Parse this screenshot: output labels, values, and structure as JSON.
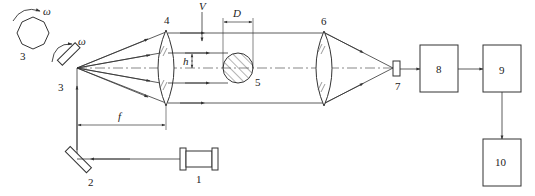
{
  "diagram": {
    "type": "laser-scanning-diameter-measurement-schematic",
    "components": [
      {
        "id": "1",
        "label": "1",
        "role": "laser source"
      },
      {
        "id": "2",
        "label": "2",
        "role": "fold mirror"
      },
      {
        "id": "3a",
        "label": "3",
        "role": "rotating polygon mirror (top view)"
      },
      {
        "id": "3b",
        "label": "3",
        "role": "rotating scanning mirror"
      },
      {
        "id": "4",
        "label": "4",
        "role": "collimating lens"
      },
      {
        "id": "5",
        "label": "5",
        "role": "measured object (rod cross-section)"
      },
      {
        "id": "6",
        "label": "6",
        "role": "focusing lens"
      },
      {
        "id": "7",
        "label": "7",
        "role": "photodetector"
      },
      {
        "id": "8",
        "label": "8",
        "role": "processing block"
      },
      {
        "id": "9",
        "label": "9",
        "role": "processing block"
      },
      {
        "id": "10",
        "label": "10",
        "role": "output block"
      }
    ],
    "symbols": {
      "omega": "ω",
      "velocity": "V",
      "diameter": "D",
      "height": "h",
      "focal_length": "f"
    },
    "connections": [
      {
        "from": "1",
        "to": "2"
      },
      {
        "from": "2",
        "to": "3b"
      },
      {
        "from": "3b",
        "to": "4"
      },
      {
        "from": "4",
        "to": "6"
      },
      {
        "from": "6",
        "to": "7"
      },
      {
        "from": "7",
        "to": "8"
      },
      {
        "from": "8",
        "to": "9"
      },
      {
        "from": "9",
        "to": "10"
      }
    ]
  }
}
